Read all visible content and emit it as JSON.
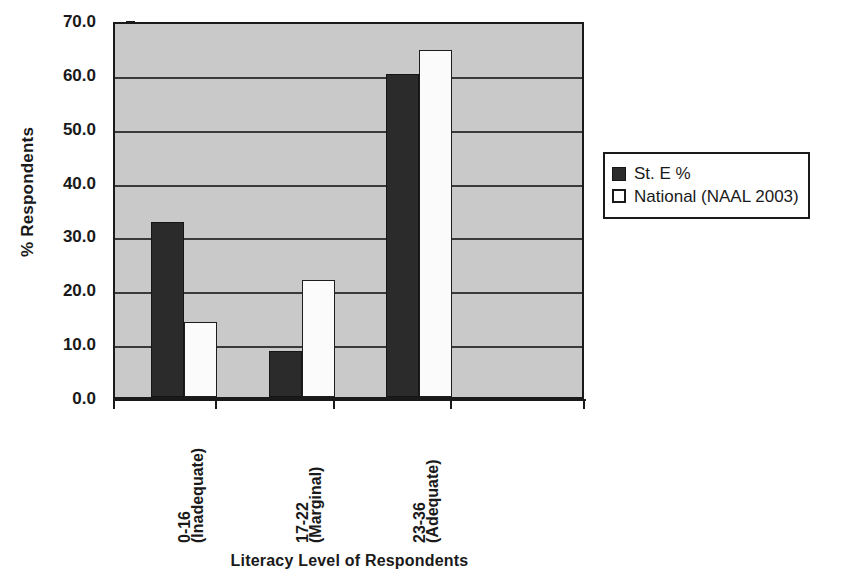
{
  "chart_data": {
    "type": "bar",
    "title": "",
    "xlabel": "Literacy Level of Respondents",
    "ylabel": "% Respondents",
    "ylim": [
      0.0,
      70.0
    ],
    "ytick_labels": [
      "70.0",
      "60.0",
      "50.0",
      "40.0",
      "30.0",
      "20.0",
      "10.0",
      "0.0"
    ],
    "ytick_values": [
      70.0,
      60.0,
      50.0,
      40.0,
      30.0,
      20.0,
      10.0,
      0.0
    ],
    "grid": true,
    "grid_axis": "y",
    "legend_position": "right",
    "plot_background": "#c9c9c9",
    "categories": [
      "0-16\n(Inadequate)",
      "17-22\n(Marginal)",
      "23-36\n(Adequate)"
    ],
    "series": [
      {
        "name": "St. E %",
        "color": "#2b2b2b",
        "values": [
          32.5,
          8.5,
          60.0
        ]
      },
      {
        "name": "National (NAAL 2003)",
        "color": "#ffffff",
        "values": [
          14.0,
          21.8,
          64.5
        ]
      }
    ]
  }
}
